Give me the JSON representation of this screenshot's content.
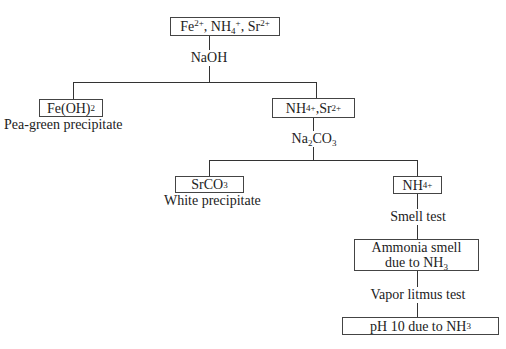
{
  "diagram": {
    "root": {
      "id": "start",
      "ions": [
        {
          "symbol": "Fe",
          "charge": "2+"
        },
        {
          "symbol": "NH",
          "sub": "4",
          "charge": "+"
        },
        {
          "symbol": "Sr",
          "charge": "2+"
        }
      ],
      "text": "Fe2+, NH4+, Sr2+"
    },
    "steps": [
      {
        "reagent": "NaOH",
        "reagent_parts": {
          "main": "NaOH"
        },
        "branches": [
          {
            "box": "Fe(OH)2",
            "box_parts": {
              "main": "Fe(OH)",
              "sub": "2"
            },
            "caption": "Pea-green precipitate"
          },
          {
            "box": "NH4+, Sr2+",
            "box_parts": {
              "a": "NH",
              "a_sub": "4",
              "a_sup": "+",
              "sep": ", ",
              "b": "Sr",
              "b_sup": "2+"
            }
          }
        ]
      },
      {
        "reagent": "Na2CO3",
        "reagent_parts": {
          "a": "Na",
          "a_sub": "2",
          "b": "CO",
          "b_sub": "3"
        },
        "branches": [
          {
            "box": "SrCO3",
            "box_parts": {
              "main": "SrCO",
              "sub": "3"
            },
            "caption": "White precipitate"
          },
          {
            "box": "NH4+",
            "box_parts": {
              "main": "NH",
              "sub": "4",
              "sup": "+"
            }
          }
        ]
      },
      {
        "reagent": "Smell test",
        "result": "Ammonia smell due to NH3",
        "result_parts": {
          "line1": "Ammonia smell",
          "line2": "due to NH",
          "sub": "3"
        }
      },
      {
        "reagent": "Vapor litmus test",
        "result": "pH 10 due to NH3",
        "result_parts": {
          "main": "pH 10 due to NH",
          "sub": "3"
        }
      }
    ]
  },
  "colors": {
    "line": "#333333",
    "border": "#444444",
    "text": "#222222",
    "background": "#ffffff"
  }
}
